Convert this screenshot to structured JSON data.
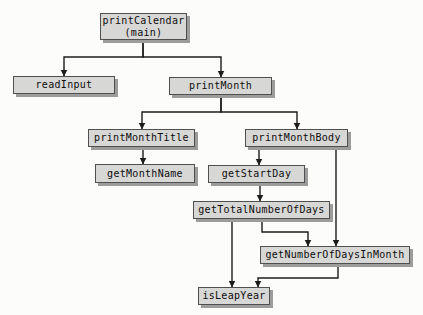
{
  "diagram": {
    "type": "structure-chart",
    "nodes": [
      {
        "id": "printCalendar",
        "label": "printCalendar\n(main)"
      },
      {
        "id": "readInput",
        "label": "readInput"
      },
      {
        "id": "printMonth",
        "label": "printMonth"
      },
      {
        "id": "printMonthTitle",
        "label": "printMonthTitle"
      },
      {
        "id": "printMonthBody",
        "label": "printMonthBody"
      },
      {
        "id": "getMonthName",
        "label": "getMonthName"
      },
      {
        "id": "getStartDay",
        "label": "getStartDay"
      },
      {
        "id": "getTotalNumberOfDays",
        "label": "getTotalNumberOfDays"
      },
      {
        "id": "getNumberOfDaysInMonth",
        "label": "getNumberOfDaysInMonth"
      },
      {
        "id": "isLeapYear",
        "label": "isLeapYear"
      }
    ],
    "edges": [
      {
        "from": "printCalendar",
        "to": "readInput"
      },
      {
        "from": "printCalendar",
        "to": "printMonth"
      },
      {
        "from": "printMonth",
        "to": "printMonthTitle"
      },
      {
        "from": "printMonth",
        "to": "printMonthBody"
      },
      {
        "from": "printMonthTitle",
        "to": "getMonthName"
      },
      {
        "from": "printMonthBody",
        "to": "getStartDay"
      },
      {
        "from": "printMonthBody",
        "to": "getNumberOfDaysInMonth"
      },
      {
        "from": "getStartDay",
        "to": "getTotalNumberOfDays"
      },
      {
        "from": "getTotalNumberOfDays",
        "to": "getNumberOfDaysInMonth"
      },
      {
        "from": "getTotalNumberOfDays",
        "to": "isLeapYear"
      },
      {
        "from": "getNumberOfDaysInMonth",
        "to": "isLeapYear"
      }
    ]
  },
  "colors": {
    "background": "#fcfcfb",
    "node_fill": "#d7d7d5",
    "node_border": "#4f4f4f",
    "node_shadow": "#9c9c9c",
    "line": "#1c1c1c"
  }
}
